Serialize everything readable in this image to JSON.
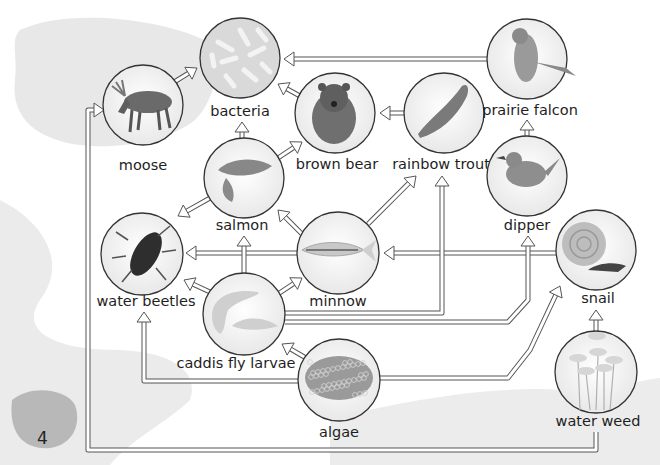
{
  "intro_text": [
    "This is a North",
    "American river",
    "food web."
  ],
  "page_number": "4",
  "nodes": [
    {
      "id": "moose",
      "label": "moose",
      "icon": "moose-icon"
    },
    {
      "id": "bacteria",
      "label": "bacteria",
      "icon": "bacteria-icon"
    },
    {
      "id": "brown-bear",
      "label": "brown bear",
      "icon": "bear-icon"
    },
    {
      "id": "rainbow-trout",
      "label": "rainbow trout",
      "icon": "trout-icon"
    },
    {
      "id": "prairie-falcon",
      "label": "prairie falcon",
      "icon": "falcon-icon"
    },
    {
      "id": "salmon",
      "label": "salmon",
      "icon": "salmon-icon"
    },
    {
      "id": "dipper",
      "label": "dipper",
      "icon": "dipper-bird-icon"
    },
    {
      "id": "water-beetles",
      "label": "water beetles",
      "icon": "beetle-icon"
    },
    {
      "id": "minnow",
      "label": "minnow",
      "icon": "minnow-icon"
    },
    {
      "id": "snail",
      "label": "snail",
      "icon": "snail-icon"
    },
    {
      "id": "caddis-fly-larvae",
      "label": "caddis fly larvae",
      "icon": "larvae-icon"
    },
    {
      "id": "algae",
      "label": "algae",
      "icon": "algae-icon"
    },
    {
      "id": "water-weed",
      "label": "water weed",
      "icon": "water-weed-icon"
    }
  ],
  "edges": [
    {
      "from": "moose",
      "to": "bacteria"
    },
    {
      "from": "prairie-falcon",
      "to": "bacteria"
    },
    {
      "from": "brown-bear",
      "to": "bacteria"
    },
    {
      "from": "salmon",
      "to": "bacteria"
    },
    {
      "from": "rainbow-trout",
      "to": "brown-bear"
    },
    {
      "from": "salmon",
      "to": "brown-bear"
    },
    {
      "from": "dipper",
      "to": "prairie-falcon"
    },
    {
      "from": "salmon",
      "to": "water-beetles"
    },
    {
      "from": "minnow",
      "to": "salmon"
    },
    {
      "from": "minnow",
      "to": "water-beetles"
    },
    {
      "from": "minnow",
      "to": "rainbow-trout"
    },
    {
      "from": "snail",
      "to": "minnow"
    },
    {
      "from": "caddis-fly-larvae",
      "to": "water-beetles"
    },
    {
      "from": "caddis-fly-larvae",
      "to": "salmon"
    },
    {
      "from": "caddis-fly-larvae",
      "to": "minnow"
    },
    {
      "from": "caddis-fly-larvae",
      "to": "rainbow-trout"
    },
    {
      "from": "caddis-fly-larvae",
      "to": "dipper"
    },
    {
      "from": "algae",
      "to": "caddis-fly-larvae"
    },
    {
      "from": "algae",
      "to": "water-beetles"
    },
    {
      "from": "algae",
      "to": "snail"
    },
    {
      "from": "water-weed",
      "to": "snail"
    },
    {
      "from": "water-weed",
      "to": "moose"
    }
  ]
}
